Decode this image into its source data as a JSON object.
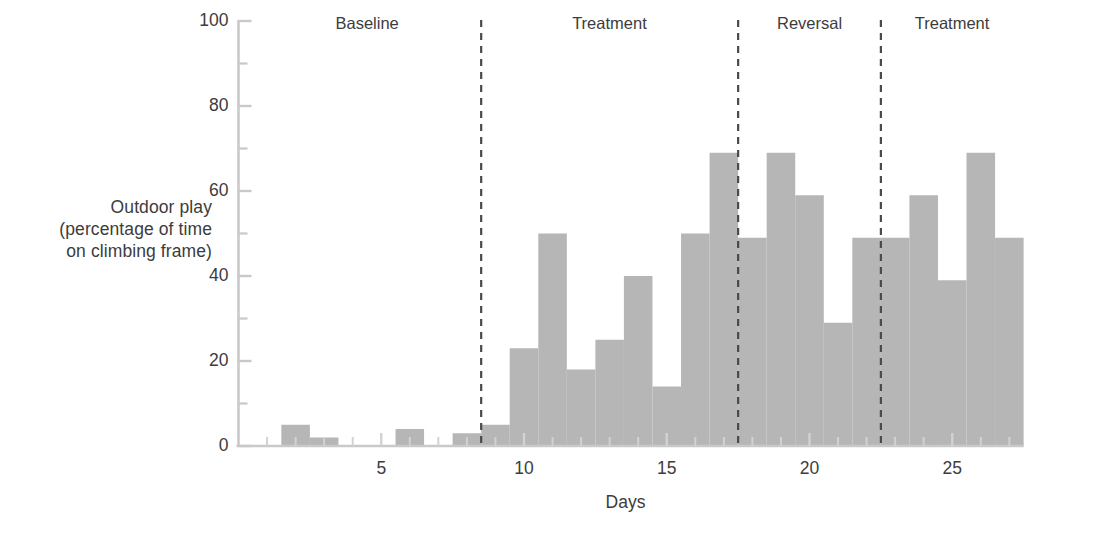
{
  "chart_data": {
    "type": "bar",
    "title": "",
    "xlabel": "Days",
    "ylabel": "Outdoor play (percentage of time on climbing frame)",
    "ylabel_lines": [
      "Outdoor play",
      "(percentage of time",
      "on climbing frame)"
    ],
    "categories": [
      1,
      2,
      3,
      4,
      5,
      6,
      7,
      8,
      9,
      10,
      11,
      12,
      13,
      14,
      15,
      16,
      17,
      18,
      19,
      20,
      21,
      22,
      23,
      24,
      25,
      26,
      27
    ],
    "values": [
      0,
      5,
      2,
      0,
      0,
      4,
      0,
      3,
      5,
      23,
      50,
      18,
      25,
      40,
      14,
      50,
      69,
      49,
      69,
      59,
      29,
      49,
      49,
      59,
      39,
      69,
      49
    ],
    "xlim": [
      0.5,
      27.5
    ],
    "ylim": [
      0,
      100
    ],
    "yticks": [
      0,
      20,
      40,
      60,
      80,
      100
    ],
    "ytick_labels": [
      "0",
      "20",
      "40",
      "60",
      "80",
      "100"
    ],
    "yminor_ticks": [
      10,
      30,
      50,
      70,
      90
    ],
    "xticks": [
      5,
      10,
      15,
      20,
      25
    ],
    "xtick_labels": [
      "5",
      "10",
      "15",
      "20",
      "25"
    ],
    "grid": false,
    "legend": "none",
    "bar_color": "#b6b6b6",
    "axis_color": "#c9c9c9",
    "text_color": "#3c3c3c",
    "dashed_line_color": "#4a4a4a",
    "phases": [
      {
        "label": "Baseline",
        "start_day": 1,
        "end_day": 8
      },
      {
        "label": "Treatment",
        "start_day": 9,
        "end_day": 17
      },
      {
        "label": "Reversal",
        "start_day": 18,
        "end_day": 22
      },
      {
        "label": "Treatment",
        "start_day": 23,
        "end_day": 27
      }
    ],
    "phase_dividers": [
      8.5,
      17.5,
      22.5
    ],
    "annotations": []
  }
}
